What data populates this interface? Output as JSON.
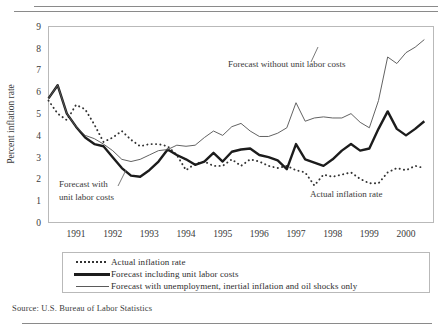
{
  "figure": {
    "source_note": "Source: U.S. Bureau of Labor Statistics"
  },
  "chart_data": {
    "type": "line",
    "title": "",
    "subtitle": "",
    "xlabel": "",
    "ylabel": "Percent inflation rate",
    "xlim": [
      1990.25,
      2000.75
    ],
    "ylim": [
      0,
      9
    ],
    "grid": false,
    "legend_position": "bottom",
    "x_ticks": [
      "1991",
      "1992",
      "1993",
      "1994",
      "1995",
      "1996",
      "1997",
      "1998",
      "1999",
      "2000"
    ],
    "x_tick_values": [
      1991,
      1992,
      1993,
      1994,
      1995,
      1996,
      1997,
      1998,
      1999,
      2000
    ],
    "y_ticks": [
      "0",
      "1",
      "2",
      "3",
      "4",
      "5",
      "6",
      "7",
      "8",
      "9"
    ],
    "y_tick_values": [
      0,
      1,
      2,
      3,
      4,
      5,
      6,
      7,
      8,
      9
    ],
    "x": [
      1990.25,
      1990.5,
      1990.75,
      1991.0,
      1991.25,
      1991.5,
      1991.75,
      1992.0,
      1992.25,
      1992.5,
      1992.75,
      1993.0,
      1993.25,
      1993.5,
      1993.75,
      1994.0,
      1994.25,
      1994.5,
      1994.75,
      1995.0,
      1995.25,
      1995.5,
      1995.75,
      1996.0,
      1996.25,
      1996.5,
      1996.75,
      1997.0,
      1997.25,
      1997.5,
      1997.75,
      1998.0,
      1998.25,
      1998.5,
      1998.75,
      1999.0,
      1999.25,
      1999.5,
      1999.75,
      2000.0,
      2000.25,
      2000.5
    ],
    "series": [
      {
        "name": "Actual inflation rate",
        "style": "dotted",
        "color": "#333333",
        "values": [
          5.6,
          5.0,
          4.7,
          5.4,
          5.2,
          4.5,
          3.7,
          3.9,
          4.2,
          3.8,
          3.5,
          3.6,
          3.6,
          3.5,
          3.1,
          2.4,
          2.7,
          2.8,
          2.6,
          2.6,
          2.9,
          2.6,
          2.9,
          2.8,
          2.6,
          2.5,
          2.6,
          2.4,
          2.3,
          1.7,
          2.2,
          2.1,
          2.2,
          2.3,
          2.0,
          1.8,
          1.8,
          2.3,
          2.5,
          2.4,
          2.6,
          2.5
        ]
      },
      {
        "name": "Forecast including unit labor costs",
        "style": "thick-solid",
        "color": "#1c1c1c",
        "values": [
          5.7,
          6.3,
          5.0,
          4.4,
          3.9,
          3.6,
          3.5,
          3.0,
          2.5,
          2.15,
          2.1,
          2.4,
          2.8,
          3.35,
          3.1,
          2.9,
          2.65,
          2.8,
          3.2,
          2.8,
          3.25,
          3.35,
          3.4,
          3.1,
          3.0,
          2.85,
          2.45,
          3.6,
          2.9,
          2.75,
          2.6,
          2.9,
          3.3,
          3.6,
          3.3,
          3.4,
          4.3,
          5.1,
          4.3,
          4.0,
          4.3,
          4.65
        ]
      },
      {
        "name": "Forecast with unemployment, inertial inflation and oil shocks only",
        "style": "thin-solid",
        "color": "#5a5a5a",
        "values": [
          5.7,
          6.3,
          5.0,
          4.4,
          4.0,
          3.85,
          3.6,
          3.3,
          2.9,
          2.8,
          2.9,
          3.1,
          3.3,
          3.35,
          3.55,
          3.5,
          3.55,
          3.9,
          4.2,
          4.0,
          4.4,
          4.55,
          4.2,
          3.95,
          3.95,
          4.1,
          4.35,
          5.5,
          4.65,
          4.8,
          4.85,
          4.8,
          4.8,
          5.0,
          4.6,
          4.35,
          5.6,
          7.6,
          7.3,
          7.8,
          8.05,
          8.4
        ]
      }
    ],
    "annotations": [
      {
        "id": "annot-forecast-without",
        "text": "Forecast without unit labor costs",
        "x_px": 228,
        "y_px": 67
      },
      {
        "id": "annot-forecast-with-line1",
        "text": "Forecast with",
        "x_px": 59,
        "y_px": 187
      },
      {
        "id": "annot-forecast-with-line2",
        "text": "unit labor costs",
        "x_px": 59,
        "y_px": 200
      },
      {
        "id": "annot-actual",
        "text": "Actual inflation rate",
        "x_px": 310,
        "y_px": 197
      }
    ],
    "legend_entries": [
      "Actual inflation rate",
      "Forecast including unit labor costs",
      "Forecast with unemployment, inertial inflation and oil shocks only"
    ]
  }
}
